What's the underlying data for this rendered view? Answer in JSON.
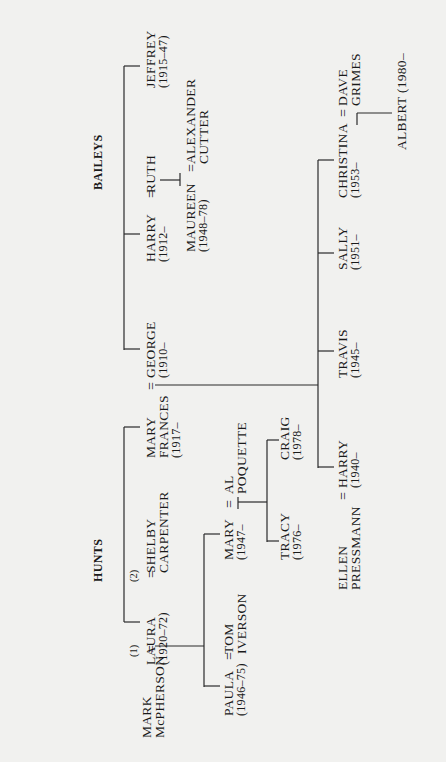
{
  "diagram": {
    "type": "family-tree",
    "orientation": "rotated-90-ccw",
    "families": {
      "baileys": "BAILEYS",
      "hunts": "HUNTS"
    },
    "people": {
      "jeffrey": {
        "name": "JEFFREY",
        "dates": "(1915–47)"
      },
      "harry_sr": {
        "name": "HARRY",
        "dates": "(1912–"
      },
      "ruth": {
        "name": "RUTH"
      },
      "maureen": {
        "name": "MAUREEN",
        "dates": "(1948–78)"
      },
      "alexander": {
        "name": "ALEXANDER",
        "name2": "CUTTER"
      },
      "george": {
        "name": "GEORGE",
        "dates": "(1910–"
      },
      "mary_frances": {
        "name": "MARY",
        "name2": "FRANCES",
        "dates": "(1917–"
      },
      "laura": {
        "name": "LAURA",
        "dates": "(1920–72)"
      },
      "shelby": {
        "name": "SHELBY",
        "name2": "CARPENTER"
      },
      "mark": {
        "name": "MARK",
        "name2": "McPHERSON"
      },
      "paula": {
        "name": "PAULA",
        "dates": "(1946–75)"
      },
      "tom": {
        "name": "TOM",
        "name2": "IVERSON"
      },
      "mary": {
        "name": "MARY",
        "dates": "(1947–"
      },
      "al": {
        "name": "AL",
        "name2": "POQUETTE"
      },
      "tracy": {
        "name": "TRACY",
        "dates": "(1976–"
      },
      "craig": {
        "name": "CRAIG",
        "dates": "(1978–"
      },
      "christina": {
        "name": "CHRISTINA",
        "dates": "(1953–"
      },
      "dave": {
        "name": "DAVE",
        "name2": "GRIMES"
      },
      "albert": {
        "name": "ALBERT (1980–"
      },
      "sally": {
        "name": "SALLY",
        "dates": "(1951–"
      },
      "travis": {
        "name": "TRAVIS",
        "dates": "(1945–"
      },
      "harry_jr": {
        "name": "HARRY",
        "dates": "(1940–"
      },
      "ellen": {
        "name": "ELLEN",
        "name2": "PRESSMANN"
      }
    },
    "symbols": {
      "married": "=",
      "first": "(1)",
      "second": "(2)"
    },
    "marriages": [
      [
        "harry_sr",
        "ruth"
      ],
      [
        "maureen",
        "alexander"
      ],
      [
        "george",
        "mary_frances"
      ],
      [
        "laura",
        "shelby",
        "(2)"
      ],
      [
        "mark",
        "laura",
        "(1)"
      ],
      [
        "paula",
        "tom"
      ],
      [
        "mary",
        "al"
      ],
      [
        "christina",
        "dave"
      ],
      [
        "ellen",
        "harry_jr"
      ]
    ],
    "children": {
      "baileys_siblings": [
        "jeffrey",
        "harry_sr",
        "george"
      ],
      "hunts_siblings": [
        "mary_frances",
        "laura"
      ],
      "harry_sr+ruth": [
        "maureen"
      ],
      "george+mary_frances": [
        "christina",
        "sally",
        "travis",
        "harry_jr"
      ],
      "christina+dave": [
        "albert"
      ],
      "mark+laura": [
        "paula",
        "mary"
      ],
      "mary+al": [
        "tracy",
        "craig"
      ]
    }
  }
}
